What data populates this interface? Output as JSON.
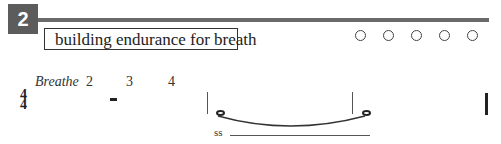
{
  "exercise": {
    "number": "2",
    "title": "building endurance for breath",
    "progress_circles": 5
  },
  "notation": {
    "counts": [
      "Breathe",
      "2",
      "3",
      "4"
    ],
    "time_signature": {
      "top": "4",
      "bottom": "4"
    },
    "dynamic_label": "ss"
  }
}
